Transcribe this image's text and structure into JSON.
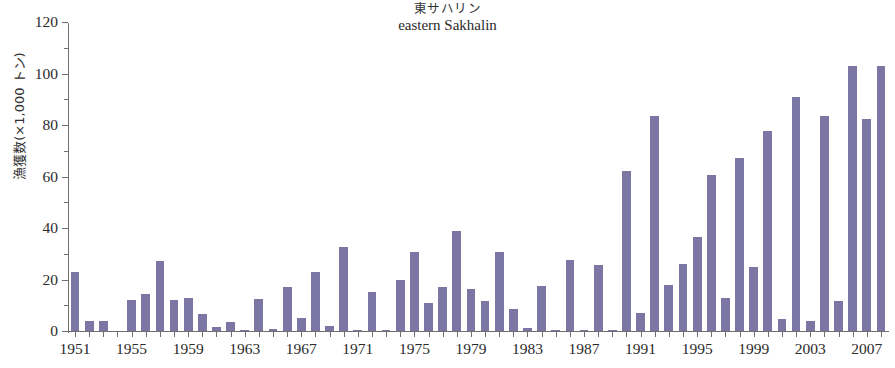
{
  "chart_data": {
    "type": "bar",
    "title": "eastern Sakhalin",
    "title_jp": "東サハリン",
    "xlabel": "",
    "ylabel": "漁獲数(×1,000 トン)",
    "ylim": [
      0,
      120
    ],
    "yticks": [
      0,
      20,
      40,
      60,
      80,
      100,
      120
    ],
    "ytick_labels": [
      "0",
      "20",
      "40",
      "60",
      "80",
      "100",
      "120"
    ],
    "yminor_ticks": [
      10,
      30,
      50,
      70,
      90,
      110
    ],
    "grid": false,
    "legend": "none",
    "bar_color": "#7b76a3",
    "axis_color": "#6f6f6f",
    "xtick_labels": [
      "1951",
      "1955",
      "1959",
      "1963",
      "1967",
      "1971",
      "1975",
      "1979",
      "1983",
      "1987",
      "1991",
      "1995",
      "1999",
      "2003",
      "2007"
    ],
    "categories": [
      "1951",
      "1952",
      "1953",
      "1954",
      "1955",
      "1956",
      "1957",
      "1958",
      "1959",
      "1960",
      "1961",
      "1962",
      "1963",
      "1964",
      "1965",
      "1966",
      "1967",
      "1968",
      "1969",
      "1970",
      "1971",
      "1972",
      "1973",
      "1974",
      "1975",
      "1976",
      "1977",
      "1978",
      "1979",
      "1980",
      "1981",
      "1982",
      "1983",
      "1984",
      "1985",
      "1986",
      "1987",
      "1988",
      "1989",
      "1990",
      "1991",
      "1992",
      "1993",
      "1994",
      "1995",
      "1996",
      "1997",
      "1998",
      "1999",
      "2000",
      "2001",
      "2002",
      "2003",
      "2004",
      "2005",
      "2006",
      "2007",
      "2008"
    ],
    "values": [
      23,
      4,
      4,
      0,
      12,
      14.5,
      27,
      12,
      13,
      6.5,
      1.5,
      3.5,
      0.5,
      12.5,
      0.7,
      17,
      5,
      23,
      2,
      32.5,
      0.3,
      15,
      0.4,
      20,
      30.5,
      11,
      17,
      39,
      16.5,
      11.5,
      30.5,
      8.5,
      1,
      17.5,
      0.3,
      27.5,
      0.3,
      25.5,
      0.5,
      62,
      7,
      83.5,
      18,
      26,
      36.5,
      60.5,
      13,
      67,
      25,
      77.5,
      4.5,
      91,
      4,
      83.5,
      11.5,
      103,
      82.5,
      103
    ]
  }
}
